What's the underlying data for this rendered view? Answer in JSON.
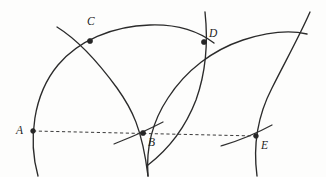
{
  "figure": {
    "kind": "geometric-construction-diagram",
    "canvas": {
      "width": 326,
      "height": 177
    },
    "background_color": "#fdfdfc",
    "ink_color": "#2b2b2b",
    "baseline": {
      "name": "dashed-baseline",
      "style": "dashed",
      "color": "#3a3a3a",
      "from": {
        "x": 33,
        "y": 131
      },
      "to": {
        "x": 256,
        "y": 136
      }
    },
    "points": [
      {
        "id": "A",
        "label": "A",
        "x": 33,
        "y": 131,
        "label_x": 16,
        "label_y": 125
      },
      {
        "id": "B",
        "label": "B",
        "x": 143,
        "y": 133,
        "label_x": 148,
        "label_y": 137
      },
      {
        "id": "C",
        "label": "C",
        "x": 90,
        "y": 41,
        "label_x": 87,
        "label_y": 16
      },
      {
        "id": "D",
        "label": "D",
        "x": 204,
        "y": 42,
        "label_x": 209,
        "label_y": 28
      },
      {
        "id": "E",
        "label": "E",
        "x": 256,
        "y": 136,
        "label_x": 261,
        "label_y": 140
      }
    ],
    "arcs": [
      {
        "name": "arc-centered-at-B-through-A-C",
        "path": "M 38 176 C 28 140 33 95 58 65 C 78 41 112 26 150 25 C 178 24 198 31 214 43"
      },
      {
        "name": "arc-centered-at-A-through-B-C",
        "path": "M 57 27 C 78 40 98 62 117 88 C 132 109 142 128 148 176"
      },
      {
        "name": "arc-centered-at-D-through-B-E-lower",
        "path": "M 148 176 C 146 150 152 122 168 98 C 186 70 213 50 243 40 C 268 32 290 30 307 34"
      },
      {
        "name": "arc-centered-at-B-through-D-E",
        "path": "M 205 12 C 208 40 206 72 196 100 C 186 126 170 148 148 165"
      },
      {
        "name": "arc-right-through-E",
        "path": "M 257 176 C 253 146 258 115 272 88 C 286 60 300 35 310 12"
      },
      {
        "name": "arc-stub-through-B",
        "path": "M 114 144 C 126 139 140 134 163 122"
      },
      {
        "name": "arc-stub-through-E",
        "path": "M 221 146 C 234 142 248 138 272 125"
      }
    ]
  }
}
